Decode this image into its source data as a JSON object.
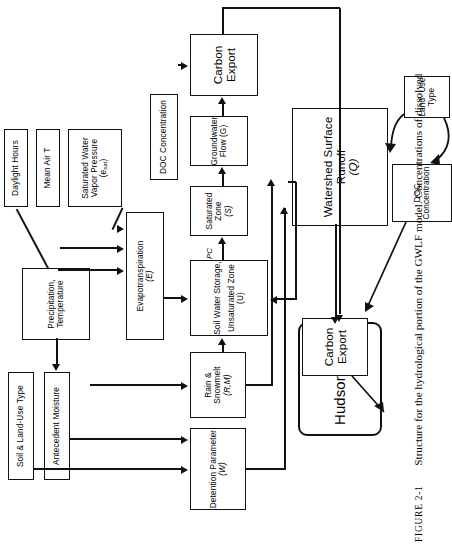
{
  "figure": {
    "number": "FIGURE 2-1",
    "caption": "Structure for the hydrological portion of the GWLF model. Concentrations of dissolved"
  },
  "diagram": {
    "nodes": {
      "soil_land_use_type": "Soil & Land-Use Type",
      "antecedent_moisture": "Antecedent Moisture",
      "precipitation_temperature": "Precipitation, Temperature",
      "daylight_hours": "Daylight Hours",
      "mean_air_t": "Mean Air T",
      "saturated_water_vapor_pressure": "Saturated Water Vapor Pressure (e",
      "saturated_water_vapor_pressure_sub": "sat",
      "saturated_water_vapor_pressure_end": ")",
      "evapotranspiration": "Evapotranspiration",
      "evapotranspiration_sym": "(E)",
      "doc_concentration_top": "DOC Concentration",
      "detention_parameter": "Detention Parameter",
      "detention_parameter_sym": "(W)",
      "rain_snowmelt": "Rain & Snowmelt",
      "rain_snowmelt_sym": "(R,M)",
      "soil_water_storage": "Soil Water Storage,",
      "soil_water_storage_2": "Unsaturated Zone (U)",
      "saturated_zone": "Saturated Zone",
      "saturated_zone_sym": "(S)",
      "groundwater_flow": "Groundwater Flow (G)",
      "carbon_export_top": "Carbon Export",
      "hudson_river": "Hudson River",
      "watershed_surface_runoff": "Watershed Surface Runoff",
      "watershed_surface_runoff_sym": "(Q)",
      "carbon_export_bottom": "Carbon Export",
      "land_use_type": "Land- Use Type",
      "doc_concentration_bottom": "DOC Concentration"
    },
    "edge_labels": {
      "percolation": "PC"
    },
    "colors": {
      "stroke": "#111111",
      "background": "#ffffff"
    }
  }
}
